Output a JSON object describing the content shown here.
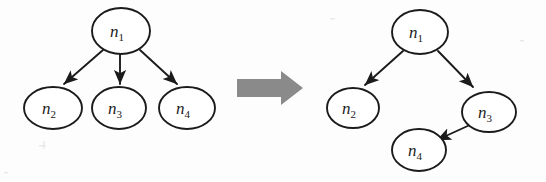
{
  "figure": {
    "background_color": "#fdfdfd",
    "stroke_color": "#1b1b1b",
    "transform_arrow_color": "#8a8a8a"
  },
  "transform_arrow": {
    "icon": "right-block-arrow",
    "label": "transforms to",
    "color": "#8a8a8a"
  },
  "left_graph": {
    "name": "before-graph",
    "caption": "",
    "nodes": [
      {
        "id": "n1",
        "base": "n",
        "sub": "1",
        "cx": 121,
        "cy": 31,
        "rx": 29,
        "ry": 23
      },
      {
        "id": "n2",
        "base": "n",
        "sub": "2",
        "cx": 53,
        "cy": 108,
        "rx": 29,
        "ry": 21
      },
      {
        "id": "n3",
        "base": "n",
        "sub": "3",
        "cx": 119,
        "cy": 108,
        "rx": 27,
        "ry": 21
      },
      {
        "id": "n4",
        "base": "n",
        "sub": "4",
        "cx": 187,
        "cy": 108,
        "rx": 28,
        "ry": 21
      }
    ],
    "edges": [
      {
        "from": "n1",
        "to": "n2",
        "label": ""
      },
      {
        "from": "n1",
        "to": "n3",
        "label": ""
      },
      {
        "from": "n1",
        "to": "n4",
        "label": ""
      }
    ]
  },
  "right_graph": {
    "name": "after-graph",
    "caption": "",
    "nodes": [
      {
        "id": "n1",
        "base": "n",
        "sub": "1",
        "cx": 420,
        "cy": 32,
        "rx": 28,
        "ry": 22
      },
      {
        "id": "n2",
        "base": "n",
        "sub": "2",
        "cx": 353,
        "cy": 108,
        "rx": 26,
        "ry": 20
      },
      {
        "id": "n3",
        "base": "n",
        "sub": "3",
        "cx": 489,
        "cy": 112,
        "rx": 27,
        "ry": 20
      },
      {
        "id": "n4",
        "base": "n",
        "sub": "4",
        "cx": 419,
        "cy": 150,
        "rx": 27,
        "ry": 21
      }
    ],
    "edges": [
      {
        "from": "n1",
        "to": "n2",
        "label": ""
      },
      {
        "from": "n1",
        "to": "n3",
        "label": ""
      },
      {
        "from": "n3",
        "to": "n4",
        "label": ""
      }
    ]
  }
}
